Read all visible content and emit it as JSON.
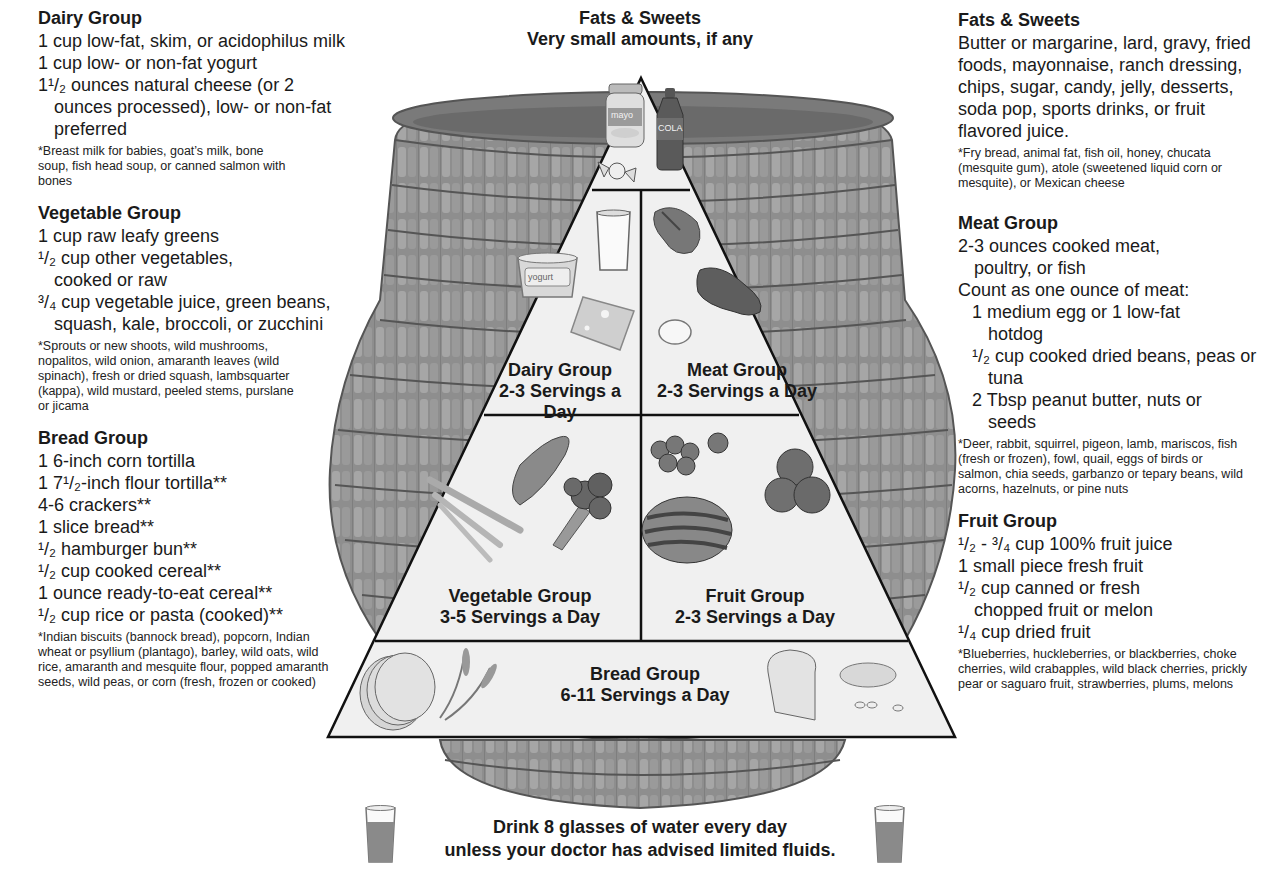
{
  "pyramid": {
    "top_title": "Fats & Sweets",
    "top_subtitle": "Very small amounts, if any",
    "tiers": {
      "dairy": {
        "name": "Dairy Group",
        "servings": "2-3 Servings a Day"
      },
      "meat": {
        "name": "Meat Group",
        "servings": "2-3 Servings a Day"
      },
      "vegetable": {
        "name": "Vegetable Group",
        "servings": "3-5 Servings a Day"
      },
      "fruit": {
        "name": "Fruit Group",
        "servings": "2-3 Servings a Day"
      },
      "bread": {
        "name": "Bread Group",
        "servings": "6-11 Servings a Day"
      }
    },
    "food_labels": {
      "mayo": "mayo",
      "cola": "COLA",
      "yogurt": "yogurt"
    },
    "water_line1": "Drink 8 glasses of water every day",
    "water_line2": "unless your doctor has advised limited fluids.",
    "colors": {
      "basket": "#8a8a8a",
      "basket_dark": "#5e5e5e",
      "pyramid_fill": "#f0f0f0",
      "outline": "#111111"
    }
  },
  "left": {
    "dairy": {
      "title": "Dairy Group",
      "items": [
        "1 cup low-fat, skim, or acidophilus milk",
        "1 cup low- or non-fat yogurt",
        "1¹/₂ ounces natural cheese (or 2 ounces processed), low- or non-fat preferred"
      ],
      "note": "*Breast milk for babies, goat’s milk, bone soup, fish head soup, or canned salmon with bones"
    },
    "vegetable": {
      "title": "Vegetable Group",
      "items": [
        "1 cup raw leafy greens",
        "¹/₂ cup other vegetables, cooked or raw",
        "³/₄ cup vegetable juice, green beans, squash, kale, broccoli, or zucchini"
      ],
      "note": "*Sprouts or new shoots, wild mushrooms, nopalitos, wild onion, amaranth leaves (wild spinach), fresh or dried squash, lambsquarter (kappa), wild mustard, peeled stems, purslane or jicama"
    },
    "bread": {
      "title": "Bread Group",
      "items": [
        "1 6-inch corn tortilla",
        "1 7¹/₂-inch flour tortilla**",
        "4-6 crackers**",
        "1 slice bread**",
        "¹/₂ hamburger bun**",
        "¹/₂ cup cooked cereal**",
        "1 ounce ready-to-eat cereal**",
        "¹/₂ cup rice or pasta (cooked)**"
      ],
      "note": "*Indian biscuits (bannock bread), popcorn, Indian wheat or psyllium (plantago), barley, wild oats, wild rice, amaranth and mesquite flour, popped amaranth seeds, wild peas, or corn (fresh, frozen or cooked)"
    }
  },
  "right": {
    "fats": {
      "title": "Fats & Sweets",
      "body": "Butter or margarine, lard, gravy, fried foods, mayonnaise, ranch dressing, chips, sugar, candy, jelly, desserts, soda pop, sports drinks, or fruit flavored juice.",
      "note": "*Fry bread, animal fat, fish oil, honey, chucata (mesquite gum), atole (sweetened liquid corn or mesquite), or Mexican cheese"
    },
    "meat": {
      "title": "Meat Group",
      "items": [
        "2-3 ounces cooked meat, poultry, or fish",
        "Count as one ounce of meat:"
      ],
      "subitems": [
        "1 medium egg or 1 low-fat hotdog",
        "¹/₂ cup cooked dried beans, peas or tuna",
        "2 Tbsp peanut butter, nuts or seeds"
      ],
      "note": "*Deer, rabbit, squirrel, pigeon, lamb, mariscos, fish (fresh or frozen), fowl, quail, eggs of birds or salmon, chia seeds, garbanzo or tepary beans, wild acorns, hazelnuts, or pine nuts"
    },
    "fruit": {
      "title": "Fruit Group",
      "items": [
        "¹/₂ - ³/₄ cup 100% fruit juice",
        "1 small piece fresh fruit",
        "¹/₂ cup canned or fresh chopped fruit or melon",
        "¹/₄ cup dried fruit"
      ],
      "note": "*Blueberries, huckleberries, or blackberries, choke cherries, wild crabapples, wild black cherries, prickly pear or saguaro fruit, strawberries, plums, melons"
    }
  }
}
